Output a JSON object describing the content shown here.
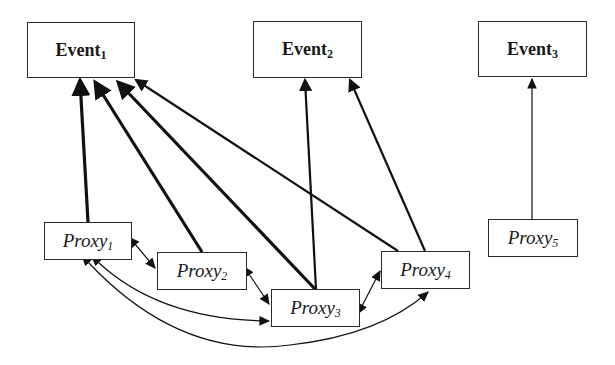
{
  "diagram": {
    "nodes": [
      {
        "id": "event1",
        "type": "event",
        "label": "Event",
        "sub": "1",
        "x": 27,
        "y": 22,
        "w": 108,
        "h": 56
      },
      {
        "id": "event2",
        "type": "event",
        "label": "Event",
        "sub": "2",
        "x": 253,
        "y": 21,
        "w": 109,
        "h": 57
      },
      {
        "id": "event3",
        "type": "event",
        "label": "Event",
        "sub": "3",
        "x": 478,
        "y": 21,
        "w": 109,
        "h": 56
      },
      {
        "id": "proxy1",
        "type": "proxy",
        "label": "Proxy",
        "sub": "1",
        "x": 44,
        "y": 222,
        "w": 88,
        "h": 38
      },
      {
        "id": "proxy2",
        "type": "proxy",
        "label": "Proxy",
        "sub": "2",
        "x": 157,
        "y": 252,
        "w": 90,
        "h": 38
      },
      {
        "id": "proxy3",
        "type": "proxy",
        "label": "Proxy",
        "sub": "3",
        "x": 271,
        "y": 289,
        "w": 89,
        "h": 38
      },
      {
        "id": "proxy4",
        "type": "proxy",
        "label": "Proxy",
        "sub": "4",
        "x": 381,
        "y": 251,
        "w": 89,
        "h": 38
      },
      {
        "id": "proxy5",
        "type": "proxy",
        "label": "Proxy",
        "sub": "5",
        "x": 488,
        "y": 219,
        "w": 90,
        "h": 38
      }
    ],
    "edges": [
      {
        "from": "proxy1",
        "to": "event1",
        "weight": "thick",
        "path": "M 88 222 L 80 80"
      },
      {
        "from": "proxy2",
        "to": "event1",
        "weight": "thick",
        "path": "M 202 252 L 95 82"
      },
      {
        "from": "proxy3",
        "to": "event1",
        "weight": "thick",
        "path": "M 315 289 L 118 82"
      },
      {
        "from": "proxy4",
        "to": "event1",
        "weight": "medium",
        "path": "M 398 251 L 136 80"
      },
      {
        "from": "proxy3",
        "to": "event2",
        "weight": "medium",
        "path": "M 316 289 L 305 80"
      },
      {
        "from": "proxy4",
        "to": "event2",
        "weight": "medium",
        "path": "M 425 251 L 350 80"
      },
      {
        "from": "proxy5",
        "to": "event3",
        "weight": "thin",
        "path": "M 532 219 L 532 79"
      },
      {
        "from": "proxy1",
        "to": "proxy2",
        "weight": "thin",
        "bidirectional": true,
        "path": "M 135 244 L 155 268"
      },
      {
        "from": "proxy2",
        "to": "proxy3",
        "weight": "thin",
        "bidirectional": true,
        "path": "M 249 274 L 269 304"
      },
      {
        "from": "proxy3",
        "to": "proxy4",
        "weight": "thin",
        "bidirectional": true,
        "path": "M 362 306 L 380 271"
      },
      {
        "from": "proxy1",
        "to": "proxy3",
        "weight": "thin",
        "bidirectional": true,
        "path": "M 98 262 Q 160 320 269 321"
      },
      {
        "from": "proxy1",
        "to": "proxy4",
        "weight": "thin",
        "bidirectional": true,
        "path": "M 88 262 Q 180 360 290 345 Q 380 335 428 292"
      }
    ]
  }
}
